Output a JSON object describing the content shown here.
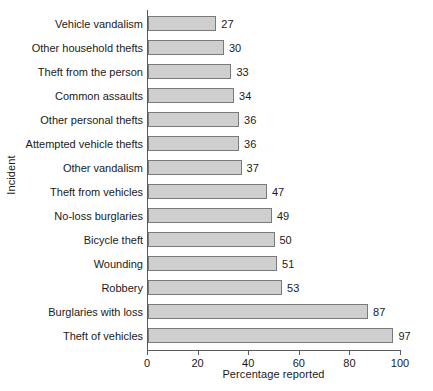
{
  "chart_data": {
    "type": "bar",
    "orientation": "horizontal",
    "title": "",
    "xlabel": "Percentage reported",
    "ylabel": "Incident",
    "xlim": [
      0,
      100
    ],
    "xticks": [
      0,
      20,
      40,
      60,
      80,
      100
    ],
    "grid": false,
    "legend": null,
    "categories": [
      "Vehicle vandalism",
      "Other household thefts",
      "Theft from the person",
      "Common assaults",
      "Other personal thefts",
      "Attempted vehicle thefts",
      "Other vandalism",
      "Theft from vehicles",
      "No-loss burglaries",
      "Bicycle theft",
      "Wounding",
      "Robbery",
      "Burglaries with loss",
      "Theft of vehicles"
    ],
    "values": [
      27,
      30,
      33,
      34,
      36,
      36,
      37,
      47,
      49,
      50,
      51,
      53,
      87,
      97
    ],
    "value_labels": [
      "27",
      "30",
      "33",
      "34",
      "36",
      "36",
      "37",
      "47",
      "49",
      "50",
      "51",
      "53",
      "87",
      "97"
    ],
    "bar_fill_color": "#cfcfcf",
    "bar_border_color": "#7a7a7a",
    "axis_color": "#5a5a5a",
    "background_color": "#ffffff"
  }
}
